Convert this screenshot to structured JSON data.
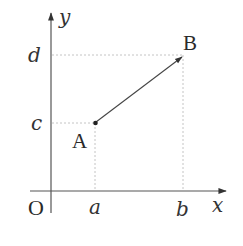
{
  "diagram": {
    "axes": {
      "x_label": "x",
      "y_label": "y",
      "origin_label": "O"
    },
    "points": {
      "start": {
        "label": "A",
        "x_label": "a",
        "y_label": "c"
      },
      "end": {
        "label": "B",
        "x_label": "b",
        "y_label": "d"
      }
    },
    "vector": {
      "from": "A",
      "to": "B"
    },
    "colors": {
      "axis": "#555555",
      "vector": "#444444",
      "guide": "#bbbbbb",
      "text": "#333333"
    }
  }
}
